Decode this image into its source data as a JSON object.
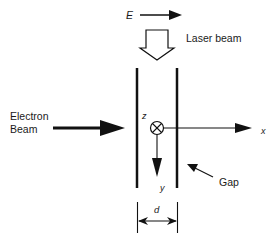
{
  "diagram": {
    "field_label": "E",
    "laser_label": "Laser beam",
    "electron_label_line1": "Electron",
    "electron_label_line2": "Beam",
    "axis_z": "z",
    "axis_x": "x",
    "axis_y": "y",
    "gap_label": "Gap",
    "width_label": "d",
    "colors": {
      "ink": "#111111",
      "background": "#ffffff"
    }
  }
}
